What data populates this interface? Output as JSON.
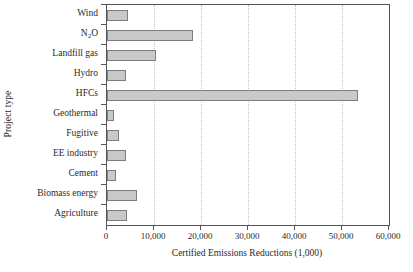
{
  "chart_data": {
    "type": "bar",
    "orientation": "horizontal",
    "title": "",
    "xlabel": "Certified Emissions Reductions (1,000)",
    "ylabel": "Project type",
    "categories": [
      "Wind",
      "N2O",
      "Landfill gas",
      "Hydro",
      "HFCs",
      "Geothermal",
      "Fugitive",
      "EE industry",
      "Cement",
      "Biomass energy",
      "Agriculture"
    ],
    "category_labels_html": [
      "Wind",
      "N<sub>2</sub>O",
      "Landfill gas",
      "Hydro",
      "HFCs",
      "Geothermal",
      "Fugitive",
      "EE industry",
      "Cement",
      "Biomass energy",
      "Agriculture"
    ],
    "values": [
      4500,
      18300,
      10400,
      4000,
      53500,
      1500,
      2500,
      4000,
      1900,
      6300,
      4200
    ],
    "xlim": [
      0,
      60000
    ],
    "xticks": [
      0,
      10000,
      20000,
      30000,
      40000,
      50000,
      60000
    ],
    "xtick_labels": [
      "0",
      "10,000",
      "20,000",
      "30,000",
      "40,000",
      "50,000",
      "60,000"
    ],
    "grid": "vertical-dotted",
    "legend": "none",
    "bar_fill_color": "#c9c9c9",
    "bar_border_color": "#7d7d7d",
    "axis_color": "#555555",
    "gridline_color": "#c0c0c0"
  }
}
